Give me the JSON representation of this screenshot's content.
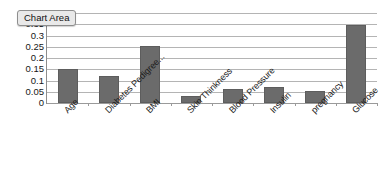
{
  "tooltip": {
    "label": "Chart Area"
  },
  "chart_data": {
    "type": "bar",
    "title": "",
    "subtitle": "",
    "xlabel": "",
    "ylabel": "",
    "categories": [
      "Age",
      "Diabetes Pedigree...",
      "BMI",
      "Skin Thinkness",
      "Blood Pressure",
      "Insulin",
      "pregnancy",
      "Glucose"
    ],
    "values": [
      0.15,
      0.12,
      0.253,
      0.03,
      0.062,
      0.072,
      0.055,
      0.345
    ],
    "ylim": [
      0,
      0.4
    ],
    "ytick_labels": [
      "0",
      "0.05",
      "0.1",
      "0.15",
      "0.2",
      "0.25",
      "0.3",
      "0.35",
      "0.4"
    ],
    "ytick_values": [
      0,
      0.05,
      0.1,
      0.15,
      0.2,
      0.25,
      0.3,
      0.35,
      0.4
    ],
    "grid": true,
    "legend": "none",
    "bar_color": "#6b6b6b",
    "gridline_color": "#b4b4b4",
    "axis_color": "#8d8d8d",
    "xlabel_rotation": -45
  }
}
